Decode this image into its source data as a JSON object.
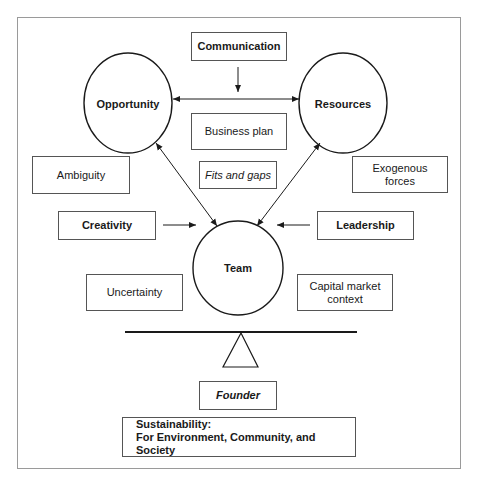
{
  "diagram": {
    "circles": {
      "opportunity": "Opportunity",
      "resources": "Resources",
      "team": "Team"
    },
    "boxes": {
      "communication": "Communication",
      "business_plan": "Business plan",
      "fits_and_gaps": "Fits and gaps",
      "ambiguity": "Ambiguity",
      "exogenous_forces_line1": "Exogenous",
      "exogenous_forces_line2": "forces",
      "creativity": "Creativity",
      "leadership": "Leadership",
      "uncertainty": "Uncertainty",
      "capital_market_line1": "Capital market",
      "capital_market_line2": "context",
      "founder": "Founder",
      "sustainability_line1": "Sustainability:",
      "sustainability_line2": "For Environment, Community, and Society"
    },
    "colors": {
      "stroke": "#1a1a1a",
      "frame": "#9a9a9a"
    }
  }
}
